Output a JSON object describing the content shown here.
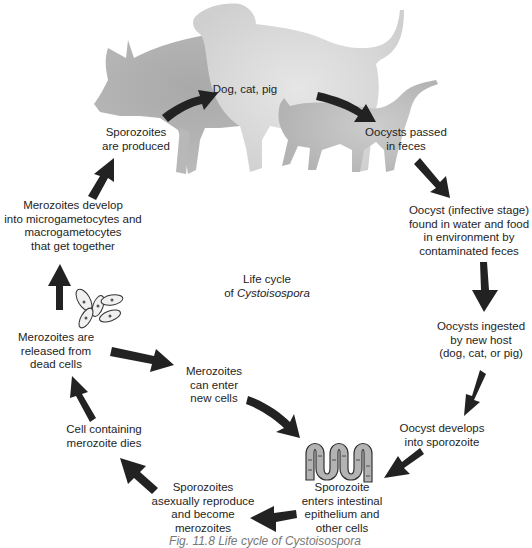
{
  "diagram": {
    "title_line1": "Life cycle",
    "title_line2_prefix": "of ",
    "title_line2_genus": "Cystoisospora",
    "hosts_label": "Dog, cat, pig",
    "colors": {
      "arrow": "#222222",
      "pig": "#b4b4b4",
      "dog": "#d2d2d2",
      "cat": "#bdbdbd",
      "intestine_fill": "#b3b3b3",
      "text": "#1e1e1e"
    },
    "stages": [
      {
        "id": "oocysts-passed",
        "lines": [
          "Oocysts passed",
          "in feces"
        ]
      },
      {
        "id": "oocyst-environment",
        "lines": [
          "Oocyst (infective stage)",
          "found in water and food",
          "in environment by",
          "contaminated feces"
        ]
      },
      {
        "id": "oocysts-ingested",
        "lines": [
          "Oocysts ingested",
          "by new host",
          "(dog, cat, or pig)"
        ]
      },
      {
        "id": "oocyst-develops",
        "lines": [
          "Oocyst develops",
          "into sporozoite"
        ]
      },
      {
        "id": "sporozoite-enters",
        "lines": [
          "Sporozoite",
          "enters intestinal",
          "epithelium and",
          "other cells"
        ]
      },
      {
        "id": "sporozoites-reproduce",
        "lines": [
          "Sporozoites",
          "asexually reproduce",
          "and become",
          "merozoites"
        ]
      },
      {
        "id": "cell-dies",
        "lines": [
          "Cell containing",
          "merozoite dies"
        ]
      },
      {
        "id": "merozoites-released",
        "lines": [
          "Merozoites are",
          "released from",
          "dead cells"
        ]
      },
      {
        "id": "merozoites-enter",
        "lines": [
          "Merozoites",
          "can enter",
          "new cells"
        ]
      },
      {
        "id": "merozoites-develop",
        "lines": [
          "Merozoites develop",
          "into microgametocytes and",
          "macrogametocytes",
          "that get together"
        ]
      },
      {
        "id": "sporozoites-produced",
        "lines": [
          "Sporozoites",
          "are produced"
        ]
      }
    ],
    "caption": "Fig. 11.8 Life cycle of Cystoisospora"
  }
}
